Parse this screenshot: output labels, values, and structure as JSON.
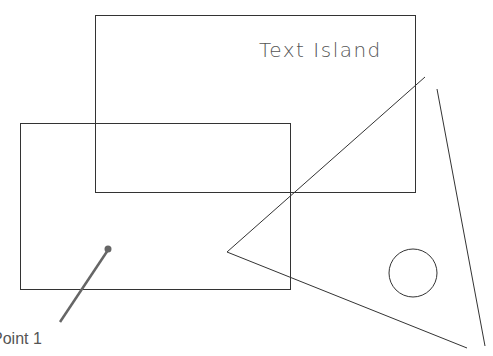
{
  "diagram": {
    "text_island": "Text Island",
    "point_label": "Point 1",
    "colors": {
      "stroke": "#333333",
      "leader": "#666666"
    },
    "shapes": [
      {
        "type": "rect",
        "name": "upper-rectangle",
        "x": 95,
        "y": 15,
        "w": 320,
        "h": 177
      },
      {
        "type": "rect",
        "name": "lower-rectangle",
        "x": 20,
        "y": 123,
        "w": 270,
        "h": 166
      },
      {
        "type": "line",
        "name": "triangle-edge-upper",
        "x1": 227,
        "y1": 252,
        "x2": 425,
        "y2": 77
      },
      {
        "type": "line",
        "name": "triangle-edge-lower",
        "x1": 227,
        "y1": 252,
        "x2": 467,
        "y2": 348
      },
      {
        "type": "line",
        "name": "right-line",
        "x1": 437,
        "y1": 89,
        "x2": 485,
        "y2": 346
      },
      {
        "type": "circle",
        "name": "circle",
        "cx": 413,
        "cy": 273,
        "r": 24
      },
      {
        "type": "leader",
        "name": "point-1-leader",
        "x1": 60,
        "y1": 322,
        "x2": 108,
        "y2": 249
      }
    ]
  }
}
